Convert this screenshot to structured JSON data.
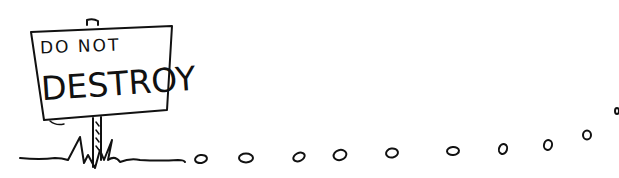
{
  "illustration": {
    "description": "Hand-drawn sketch of a signpost stuck in grass with a trail of small pebbles/circles leading off to the right",
    "sign": {
      "line1": "DO NOT",
      "line2": "DESTROY"
    },
    "trail": {
      "dot_count": 10
    },
    "colors": {
      "ink": "#111111",
      "background": "#ffffff"
    }
  }
}
